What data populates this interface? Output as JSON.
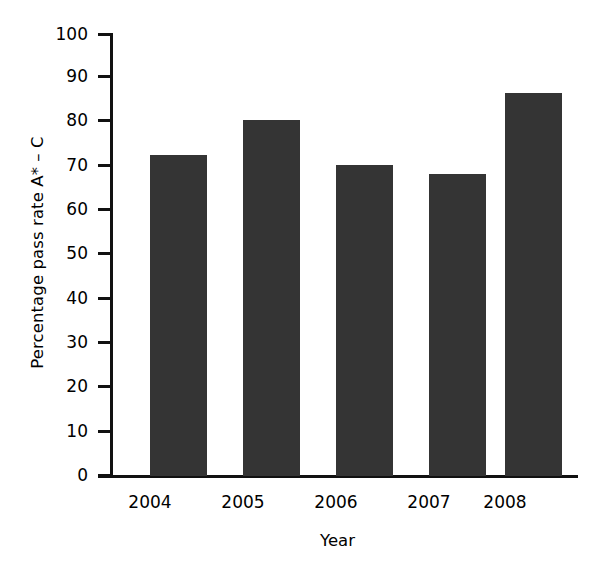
{
  "chart_data": {
    "type": "bar",
    "title": "",
    "categories": [
      "2004",
      "2005",
      "2006",
      "2007",
      "2008"
    ],
    "values": [
      72.5,
      80.3,
      70.3,
      68.2,
      86.4
    ],
    "xlabel": "Year",
    "ylabel": "Percentage pass rate A* – C",
    "ylim": [
      0,
      100
    ],
    "ytick_labels": [
      "0",
      "10",
      "20",
      "30",
      "40",
      "50",
      "60",
      "70",
      "80",
      "90",
      "100"
    ],
    "ytick_values": [
      0,
      10,
      20,
      30,
      40,
      50,
      60,
      70,
      80,
      90,
      100
    ],
    "grid": false,
    "legend": null,
    "bar_color": "#343434",
    "axis_color": "#111111",
    "background_color": "#ffffff"
  }
}
